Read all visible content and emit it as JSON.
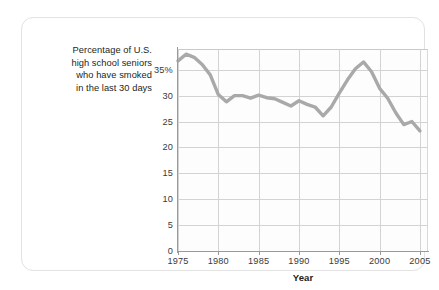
{
  "caption": {
    "lines": [
      "Percentage of U.S.",
      "high school seniors",
      "who have smoked",
      "in the last 30 days"
    ]
  },
  "colors": {
    "line": "#a9a9a9",
    "grid": "#d3d3d3",
    "axis": "#9a9a9a",
    "text": "#231f20",
    "card_border": "#e2e2e2",
    "plot_background": "#fdfdfd"
  },
  "chart_data": {
    "type": "line",
    "title": "",
    "subtitle": "",
    "xlabel": "Year",
    "ylabel": "Percentage of U.S. high school seniors who have smoked in the last 30 days",
    "xlim": [
      1975,
      2006
    ],
    "ylim": [
      0,
      39
    ],
    "grid": true,
    "legend": "none",
    "ytick_labels": [
      "0",
      "5",
      "10",
      "15",
      "20",
      "25",
      "30",
      "35%"
    ],
    "ytick_values": [
      0,
      5,
      10,
      15,
      20,
      25,
      30,
      35
    ],
    "xtick_labels": [
      "1975",
      "1980",
      "1985",
      "1990",
      "1995",
      "2000",
      "2005"
    ],
    "xtick_values": [
      1975,
      1980,
      1985,
      1990,
      1995,
      2000,
      2005
    ],
    "series": [
      {
        "name": "Percentage of U.S. high school seniors who have smoked in the last 30 days",
        "color": "#a9a9a9",
        "x": [
          1975,
          1976,
          1977,
          1978,
          1979,
          1980,
          1981,
          1982,
          1983,
          1984,
          1985,
          1986,
          1987,
          1988,
          1989,
          1990,
          1991,
          1992,
          1993,
          1994,
          1995,
          1996,
          1997,
          1998,
          1999,
          2000,
          2001,
          2002,
          2003,
          2004,
          2005
        ],
        "values": [
          36.7,
          38.0,
          37.4,
          36.0,
          34.0,
          30.2,
          28.8,
          30.0,
          30.0,
          29.5,
          30.1,
          29.6,
          29.4,
          28.7,
          28.0,
          29.0,
          28.3,
          27.8,
          26.1,
          27.8,
          30.5,
          33.0,
          35.2,
          36.5,
          34.6,
          31.4,
          29.5,
          26.7,
          24.4,
          25.0,
          23.2
        ]
      }
    ]
  }
}
